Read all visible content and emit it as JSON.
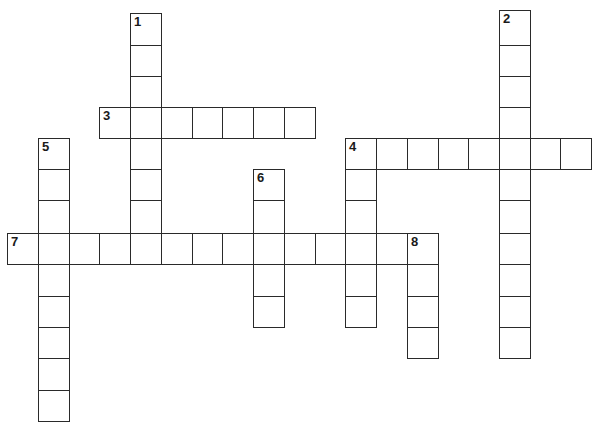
{
  "puzzle": {
    "type": "crossword",
    "cell_size": 31,
    "border_color": "#2a2a2a",
    "background": "#ffffff",
    "col_x": [
      7,
      38,
      69,
      99,
      130,
      161,
      192,
      222,
      253,
      284,
      315,
      345,
      376,
      407,
      438,
      468,
      499,
      530,
      560
    ],
    "row_y": [
      13,
      45,
      76,
      107,
      138,
      169,
      200,
      233,
      264,
      296,
      327,
      358,
      390
    ],
    "words": [
      {
        "number": "1",
        "direction": "down",
        "col": 4,
        "row": 0,
        "length": 8
      },
      {
        "number": "2",
        "direction": "down",
        "col": 16,
        "row": 0,
        "length": 11,
        "y_offset": -3
      },
      {
        "number": "3",
        "direction": "across",
        "col": 3,
        "row": 3,
        "length": 7
      },
      {
        "number": "4",
        "direction": "across",
        "col": 11,
        "row": 4,
        "length": 8
      },
      {
        "number": "",
        "direction": "down",
        "col": 11,
        "row": 4,
        "length": 6
      },
      {
        "number": "5",
        "direction": "down",
        "col": 1,
        "row": 4,
        "length": 9
      },
      {
        "number": "6",
        "direction": "down",
        "col": 8,
        "row": 5,
        "length": 5
      },
      {
        "number": "7",
        "direction": "across",
        "col": 0,
        "row": 7,
        "length": 14
      },
      {
        "number": "8",
        "direction": "down",
        "col": 13,
        "row": 7,
        "length": 4
      }
    ]
  }
}
